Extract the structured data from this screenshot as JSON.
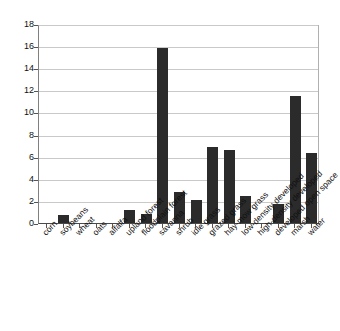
{
  "chart_data": {
    "type": "bar",
    "title": "",
    "subtitle": "",
    "xlabel": "",
    "ylabel": "",
    "ylim": [
      0,
      18
    ],
    "ytick_step": 2,
    "yticks": [
      0,
      2,
      4,
      6,
      8,
      10,
      12,
      14,
      16,
      18
    ],
    "grid": true,
    "legend": false,
    "legend_position": "none",
    "bar_color": "#2b2b2b",
    "categories": [
      "corn",
      "soybeans",
      "wheat",
      "oats",
      "alfalfa",
      "upland forest",
      "floodplain forest",
      "savanna",
      "shrub",
      "idle grass",
      "grazed grass",
      "hay-mow grass",
      "low-density developed",
      "high-density developed",
      "developed open space",
      "marsh",
      "water"
    ],
    "values": [
      0,
      0.7,
      0,
      0,
      0,
      1.15,
      0.8,
      15.85,
      2.85,
      2.05,
      6.9,
      6.6,
      2.4,
      0,
      1.75,
      11.45,
      6.35
    ]
  }
}
